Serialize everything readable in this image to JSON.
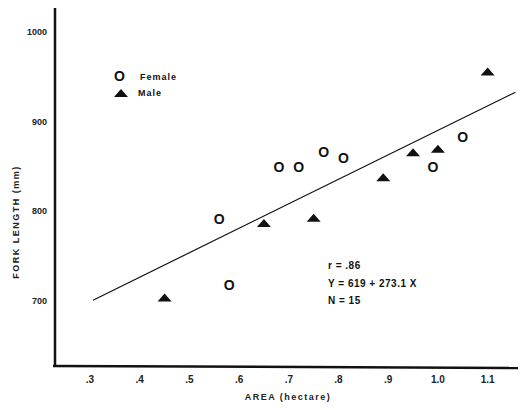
{
  "chart_data": {
    "type": "scatter",
    "title": "",
    "xlabel": "AREA  (hectare)",
    "ylabel": "FORK LENGTH  (mm)",
    "xlim": [
      0.23,
      1.17
    ],
    "ylim": [
      625,
      1030
    ],
    "x_ticks": [
      ".3",
      ".4",
      ".5",
      ".6",
      ".7",
      ".8",
      ".9",
      "1.0",
      "1.1"
    ],
    "x_tick_values": [
      0.3,
      0.4,
      0.5,
      0.6,
      0.7,
      0.8,
      0.9,
      1.0,
      1.1
    ],
    "y_ticks": [
      "700",
      "800",
      "900",
      "1000"
    ],
    "y_tick_values": [
      700,
      800,
      900,
      1000
    ],
    "grid": false,
    "legend": {
      "position": "upper-left",
      "entries": [
        {
          "symbol": "O",
          "marker": "circle-letter",
          "label": "Female"
        },
        {
          "symbol": "▲",
          "marker": "triangle",
          "label": "Male"
        }
      ]
    },
    "series": [
      {
        "name": "Female",
        "marker": "O",
        "points": [
          {
            "x": 0.56,
            "y": 792
          },
          {
            "x": 0.58,
            "y": 718
          },
          {
            "x": 0.68,
            "y": 849
          },
          {
            "x": 0.72,
            "y": 849
          },
          {
            "x": 0.77,
            "y": 866
          },
          {
            "x": 0.81,
            "y": 860
          },
          {
            "x": 0.99,
            "y": 849
          },
          {
            "x": 1.05,
            "y": 883
          }
        ]
      },
      {
        "name": "Male",
        "marker": "triangle",
        "points": [
          {
            "x": 0.45,
            "y": 704
          },
          {
            "x": 0.65,
            "y": 787
          },
          {
            "x": 0.75,
            "y": 793
          },
          {
            "x": 0.89,
            "y": 838
          },
          {
            "x": 0.95,
            "y": 866
          },
          {
            "x": 1.0,
            "y": 870
          },
          {
            "x": 1.1,
            "y": 956
          }
        ]
      }
    ],
    "regression": {
      "equation": "Y = 619 + 273.1 X",
      "intercept": 619,
      "slope": 273.1,
      "x_range": [
        0.3,
        1.15
      ]
    },
    "annotations": {
      "r": "r = .86",
      "equation": "Y = 619 + 273.1 X",
      "n": "N = 15"
    }
  }
}
